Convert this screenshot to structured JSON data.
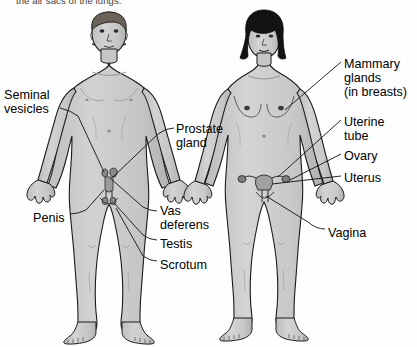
{
  "figure": {
    "title_fragment_top": "the air sacs of the lungs.",
    "background_color": "#fefefe",
    "body_fill_color": "#c9c9c9",
    "body_shade_color": "#b4b4b4",
    "outline_color": "#1a1a1a",
    "hair_color_male": "#6b6257",
    "hair_color_female": "#131313",
    "organ_fill_color": "#8e8e8e",
    "leader_line_color": "#1a1a1a",
    "text_color": "#000000"
  },
  "male_figure": {
    "name": "male-body-diagram",
    "labels": [
      {
        "id": "seminal-vesicles",
        "text": "Seminal\nvesicles",
        "x": 4,
        "y": 88,
        "align": "left"
      },
      {
        "id": "prostate-gland",
        "text": "Prostate\ngland",
        "x": 176,
        "y": 122,
        "align": "left"
      },
      {
        "id": "penis",
        "text": "Penis",
        "x": 33,
        "y": 211,
        "align": "left"
      },
      {
        "id": "vas-deferens",
        "text": "Vas\ndeferens",
        "x": 160,
        "y": 204,
        "align": "left"
      },
      {
        "id": "testis",
        "text": "Testis",
        "x": 160,
        "y": 237,
        "align": "left"
      },
      {
        "id": "scrotum",
        "text": "Scrotum",
        "x": 160,
        "y": 258,
        "align": "left"
      }
    ]
  },
  "female_figure": {
    "name": "female-body-diagram",
    "labels": [
      {
        "id": "mammary-glands",
        "text": "Mammary\nglands\n(in breasts)",
        "x": 344,
        "y": 57,
        "align": "left"
      },
      {
        "id": "uterine-tube",
        "text": "Uterine\ntube",
        "x": 344,
        "y": 115,
        "align": "left"
      },
      {
        "id": "ovary",
        "text": "Ovary",
        "x": 344,
        "y": 149,
        "align": "left"
      },
      {
        "id": "uterus",
        "text": "Uterus",
        "x": 344,
        "y": 171,
        "align": "left"
      },
      {
        "id": "vagina",
        "text": "Vagina",
        "x": 328,
        "y": 226,
        "align": "left"
      }
    ]
  }
}
